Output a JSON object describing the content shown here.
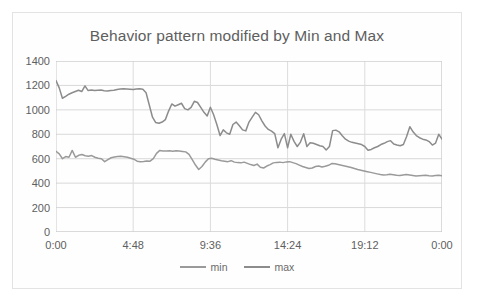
{
  "chart_data": {
    "type": "line",
    "title": "Behavior pattern modified by Min and Max",
    "xlabel": "",
    "ylabel": "",
    "ylim": [
      0,
      1400
    ],
    "yticks": [
      0,
      200,
      400,
      600,
      800,
      1000,
      1200,
      1400
    ],
    "ytick_labels": [
      "0",
      "200",
      "400",
      "600",
      "800",
      "1000",
      "1200",
      "1400"
    ],
    "xticks": [
      0,
      288,
      576,
      864,
      1152,
      1440
    ],
    "xtick_labels": [
      "0:00",
      "4:48",
      "9:36",
      "14:24",
      "19:12",
      "0:00"
    ],
    "xlim": [
      0,
      1440
    ],
    "grid": "horizontal-and-vertical",
    "legend_position": "bottom-center",
    "legend": [
      "min",
      "max"
    ],
    "series": [
      {
        "name": "min",
        "color": "#9a9a9a",
        "values": [
          660,
          640,
          600,
          618,
          612,
          668,
          612,
          628,
          634,
          624,
          620,
          626,
          612,
          604,
          600,
          576,
          592,
          608,
          614,
          618,
          620,
          616,
          612,
          604,
          596,
          580,
          576,
          578,
          582,
          580,
          600,
          644,
          668,
          664,
          664,
          666,
          662,
          666,
          664,
          660,
          656,
          636,
          592,
          548,
          512,
          536,
          572,
          600,
          604,
          596,
          590,
          584,
          580,
          576,
          584,
          572,
          568,
          566,
          572,
          562,
          552,
          544,
          556,
          530,
          524,
          540,
          552,
          566,
          570,
          572,
          568,
          574,
          576,
          568,
          560,
          548,
          536,
          528,
          520,
          524,
          536,
          540,
          532,
          538,
          546,
          560,
          558,
          552,
          546,
          540,
          534,
          528,
          520,
          512,
          506,
          500,
          494,
          488,
          482,
          476,
          470,
          466,
          468,
          472,
          468,
          464,
          462,
          466,
          470,
          466,
          462,
          458,
          460,
          462,
          464,
          460,
          458,
          462,
          464,
          460
        ]
      },
      {
        "name": "max",
        "color": "#8c8c8c",
        "values": [
          1240,
          1180,
          1095,
          1110,
          1128,
          1140,
          1150,
          1160,
          1150,
          1196,
          1158,
          1162,
          1158,
          1160,
          1162,
          1156,
          1154,
          1158,
          1160,
          1166,
          1170,
          1172,
          1170,
          1168,
          1166,
          1170,
          1172,
          1168,
          1140,
          1040,
          940,
          896,
          890,
          900,
          920,
          990,
          1048,
          1030,
          1042,
          1054,
          1010,
          1000,
          1020,
          1070,
          1060,
          1020,
          980,
          950,
          1022,
          960,
          880,
          790,
          836,
          812,
          800,
          880,
          900,
          870,
          836,
          828,
          900,
          940,
          980,
          960,
          910,
          868,
          840,
          826,
          806,
          690,
          760,
          806,
          690,
          800,
          742,
          700,
          736,
          804,
          700,
          730,
          726,
          716,
          706,
          700,
          672,
          700,
          830,
          834,
          820,
          788,
          760,
          744,
          734,
          728,
          722,
          716,
          700,
          670,
          676,
          690,
          700,
          716,
          726,
          740,
          748,
          720,
          712,
          706,
          716,
          782,
          862,
          820,
          790,
          772,
          760,
          754,
          740,
          712,
          728,
          800,
          760
        ]
      }
    ]
  }
}
